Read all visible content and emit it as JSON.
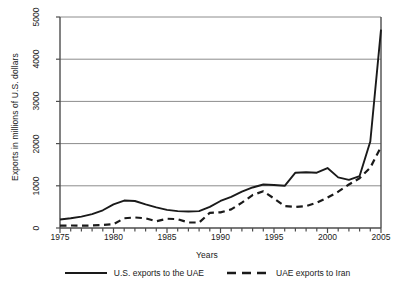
{
  "chart_data": {
    "type": "line",
    "title": "",
    "xlabel": "Years",
    "ylabel": "Exports in millions of U.S. dollars",
    "xlim": [
      1975,
      2005
    ],
    "ylim": [
      0,
      5000
    ],
    "yticks": [
      0,
      1000,
      2000,
      3000,
      4000,
      5000
    ],
    "ytick_labels": [
      "0",
      "1000",
      "2000",
      "3000",
      "4000",
      "5000"
    ],
    "xticks": [
      1975,
      1980,
      1985,
      1990,
      1995,
      2000,
      2005
    ],
    "xtick_labels": [
      "1975",
      "1980",
      "1985",
      "1990",
      "1995",
      "2000",
      "2005"
    ],
    "xminor_step": 1,
    "grid": "horizontal",
    "legend_position": "bottom",
    "x": [
      1975,
      1976,
      1977,
      1978,
      1979,
      1980,
      1981,
      1982,
      1983,
      1984,
      1985,
      1986,
      1987,
      1988,
      1989,
      1990,
      1991,
      1992,
      1993,
      1994,
      1995,
      1996,
      1997,
      1998,
      1999,
      2000,
      2001,
      2002,
      2003,
      2004,
      2005
    ],
    "series": [
      {
        "name": "U.S. exports to the UAE",
        "style": "solid",
        "color": "#1a1a1a",
        "values": [
          200,
          230,
          270,
          330,
          420,
          560,
          650,
          640,
          560,
          490,
          430,
          400,
          390,
          400,
          500,
          640,
          740,
          860,
          960,
          1030,
          1020,
          1000,
          1310,
          1320,
          1310,
          1420,
          1200,
          1140,
          1230,
          2050,
          4700
        ]
      },
      {
        "name": "UAE exports to Iran",
        "style": "dashed",
        "color": "#1a1a1a",
        "values": [
          55,
          60,
          55,
          60,
          70,
          90,
          230,
          250,
          230,
          160,
          220,
          210,
          130,
          130,
          360,
          370,
          440,
          600,
          780,
          870,
          700,
          520,
          500,
          520,
          600,
          720,
          860,
          1030,
          1180,
          1430,
          1920
        ]
      }
    ]
  },
  "legend": {
    "entries": [
      {
        "label": "U.S. exports to the UAE",
        "style": "solid"
      },
      {
        "label": "UAE exports to Iran",
        "style": "dashed"
      }
    ]
  },
  "colors": {
    "ink": "#1a1a1a",
    "grid": "#8c8c8c",
    "frame": "#4d4d4d",
    "background": "#ffffff"
  }
}
